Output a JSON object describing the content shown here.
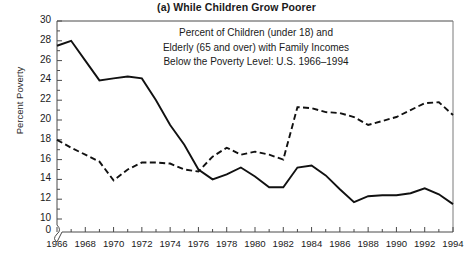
{
  "chart_data": {
    "type": "line",
    "title": "(a) While Children Grow Poorer",
    "xlabel": "",
    "ylabel": "Percent Poverty",
    "annotation_lines": [
      "Percent of Children (under 18) and",
      "Elderly (65 and over) with Family Incomes",
      "Below the Poverty Level: U.S. 1966–1994"
    ],
    "xlim": [
      1966,
      1994
    ],
    "ylim": [
      10,
      30
    ],
    "y_axis_break": true,
    "y_break_label": "0",
    "ytick_labels": [
      "30",
      "28",
      "26",
      "24",
      "22",
      "20",
      "18",
      "16",
      "14",
      "12",
      "10"
    ],
    "yticks": [
      30,
      28,
      26,
      24,
      22,
      20,
      18,
      16,
      14,
      12,
      10
    ],
    "yticks_minor_step": 1,
    "xtick_labels": [
      "1966",
      "1968",
      "1970",
      "1972",
      "1974",
      "1976",
      "1978",
      "1980",
      "1982",
      "1984",
      "1986",
      "1988",
      "1990",
      "1992",
      "1994"
    ],
    "xticks": [
      1966,
      1968,
      1970,
      1972,
      1974,
      1976,
      1978,
      1980,
      1982,
      1984,
      1986,
      1988,
      1990,
      1992,
      1994
    ],
    "xticks_minor_step": 1,
    "grid": false,
    "legend": "none",
    "x": [
      1966,
      1967,
      1968,
      1969,
      1970,
      1971,
      1972,
      1973,
      1974,
      1975,
      1976,
      1977,
      1978,
      1979,
      1980,
      1981,
      1982,
      1983,
      1984,
      1985,
      1986,
      1987,
      1988,
      1989,
      1990,
      1991,
      1992,
      1993,
      1994
    ],
    "series": [
      {
        "name": "Children (under 18)",
        "style": "solid",
        "color": "#111111",
        "values": [
          27.5,
          28.0,
          26.0,
          24.0,
          24.2,
          24.4,
          24.2,
          22.0,
          19.5,
          17.5,
          15.0,
          14.0,
          14.5,
          15.2,
          14.3,
          13.2,
          13.2,
          15.2,
          15.4,
          14.4,
          13.0,
          11.7,
          12.3,
          12.4,
          12.4,
          12.6,
          13.1,
          12.5,
          11.5
        ]
      },
      {
        "name": "Elderly (65 and over)",
        "style": "dashed",
        "color": "#111111",
        "values": [
          18.0,
          17.2,
          16.5,
          15.8,
          13.9,
          15.0,
          15.7,
          15.7,
          15.6,
          15.0,
          14.8,
          16.3,
          17.2,
          16.5,
          16.8,
          16.5,
          16.0,
          21.3,
          21.2,
          20.8,
          20.7,
          20.3,
          19.5,
          19.9,
          20.3,
          21.0,
          21.7,
          21.8,
          20.5
        ]
      }
    ]
  },
  "axis": {
    "x_label_values": [
      "1966",
      "1968",
      "1970",
      "1972",
      "1974",
      "1976",
      "1978",
      "1980",
      "1982",
      "1984",
      "1986",
      "1988",
      "1990",
      "1992",
      "1994"
    ],
    "y_label_values": [
      "30",
      "28",
      "26",
      "24",
      "22",
      "20",
      "18",
      "16",
      "14",
      "12",
      "10",
      "0"
    ]
  }
}
